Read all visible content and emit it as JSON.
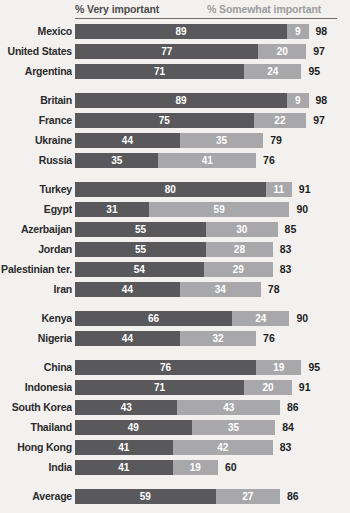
{
  "chart_data": {
    "type": "bar",
    "subtype": "stacked-horizontal",
    "title": "",
    "xlabel": "",
    "ylabel": "",
    "xlim": [
      0,
      100
    ],
    "grid": false,
    "legend_position": "top",
    "legend": [
      "% Very important",
      "% Somewhat important"
    ],
    "series": [
      {
        "name": "% Very important",
        "color": "#59595b",
        "values": [
          89,
          77,
          71,
          89,
          75,
          44,
          35,
          80,
          31,
          55,
          55,
          54,
          44,
          66,
          44,
          76,
          71,
          43,
          49,
          41,
          41,
          59
        ]
      },
      {
        "name": "% Somewhat important",
        "color": "#a8a8aa",
        "values": [
          9,
          20,
          24,
          9,
          22,
          35,
          41,
          11,
          59,
          30,
          28,
          29,
          34,
          24,
          32,
          19,
          20,
          43,
          35,
          42,
          19,
          27
        ]
      }
    ],
    "categories": [
      "Mexico",
      "United States",
      "Argentina",
      "Britain",
      "France",
      "Ukraine",
      "Russia",
      "Turkey",
      "Egypt",
      "Azerbaijan",
      "Jordan",
      "Palestinian ter.",
      "Iran",
      "Kenya",
      "Nigeria",
      "China",
      "Indonesia",
      "South Korea",
      "Thailand",
      "Hong Kong",
      "India",
      "Average"
    ],
    "totals": [
      98,
      97,
      95,
      98,
      97,
      79,
      76,
      91,
      90,
      85,
      83,
      83,
      78,
      90,
      76,
      95,
      91,
      86,
      84,
      83,
      60,
      86
    ],
    "groups": [
      {
        "rows": [
          0,
          1,
          2
        ]
      },
      {
        "rows": [
          3,
          4,
          5,
          6
        ]
      },
      {
        "rows": [
          7,
          8,
          9,
          10,
          11,
          12
        ]
      },
      {
        "rows": [
          13,
          14
        ]
      },
      {
        "rows": [
          15,
          16,
          17,
          18,
          19,
          20
        ]
      },
      {
        "rows": [
          21
        ]
      }
    ]
  },
  "legend": {
    "very_important": "% Very important",
    "somewhat_important": "% Somewhat important"
  },
  "rows": [
    {
      "label": "Mexico",
      "very": 89,
      "somewhat": 9,
      "total": 98
    },
    {
      "label": "United States",
      "very": 77,
      "somewhat": 20,
      "total": 97
    },
    {
      "label": "Argentina",
      "very": 71,
      "somewhat": 24,
      "total": 95
    },
    {
      "label": "Britain",
      "very": 89,
      "somewhat": 9,
      "total": 98
    },
    {
      "label": "France",
      "very": 75,
      "somewhat": 22,
      "total": 97
    },
    {
      "label": "Ukraine",
      "very": 44,
      "somewhat": 35,
      "total": 79
    },
    {
      "label": "Russia",
      "very": 35,
      "somewhat": 41,
      "total": 76
    },
    {
      "label": "Turkey",
      "very": 80,
      "somewhat": 11,
      "total": 91
    },
    {
      "label": "Egypt",
      "very": 31,
      "somewhat": 59,
      "total": 90
    },
    {
      "label": "Azerbaijan",
      "very": 55,
      "somewhat": 30,
      "total": 85
    },
    {
      "label": "Jordan",
      "very": 55,
      "somewhat": 28,
      "total": 83
    },
    {
      "label": "Palestinian ter.",
      "very": 54,
      "somewhat": 29,
      "total": 83
    },
    {
      "label": "Iran",
      "very": 44,
      "somewhat": 34,
      "total": 78
    },
    {
      "label": "Kenya",
      "very": 66,
      "somewhat": 24,
      "total": 90
    },
    {
      "label": "Nigeria",
      "very": 44,
      "somewhat": 32,
      "total": 76
    },
    {
      "label": "China",
      "very": 76,
      "somewhat": 19,
      "total": 95
    },
    {
      "label": "Indonesia",
      "very": 71,
      "somewhat": 20,
      "total": 91
    },
    {
      "label": "South Korea",
      "very": 43,
      "somewhat": 43,
      "total": 86
    },
    {
      "label": "Thailand",
      "very": 49,
      "somewhat": 35,
      "total": 84
    },
    {
      "label": "Hong Kong",
      "very": 41,
      "somewhat": 42,
      "total": 83
    },
    {
      "label": "India",
      "very": 41,
      "somewhat": 19,
      "total": 60
    },
    {
      "label": "Average",
      "very": 59,
      "somewhat": 27,
      "total": 86
    }
  ],
  "group_breaks_after": [
    2,
    6,
    12,
    14,
    20
  ],
  "colors": {
    "very_important": "#59595b",
    "somewhat_important": "#a8a8aa",
    "background": "#f2f1ef",
    "label_text": "#2b2b2b",
    "value_text": "#ffffff",
    "total_text": "#1d1d1d",
    "rule": "#6e6e70"
  }
}
